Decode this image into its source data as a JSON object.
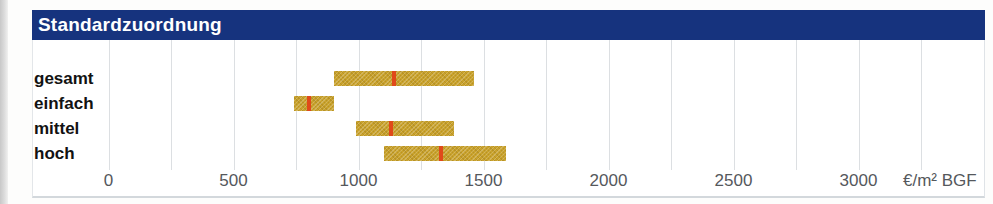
{
  "title": "Standardzuordnung",
  "axis": {
    "unit_label": "€/m² BGF"
  },
  "chart_data": {
    "type": "bar",
    "orientation": "horizontal-range",
    "title": "Standardzuordnung",
    "categories": [
      "gesamt",
      "einfach",
      "mittel",
      "hoch"
    ],
    "series": [
      {
        "name": "range_min",
        "values": [
          900,
          740,
          990,
          1100
        ]
      },
      {
        "name": "range_max",
        "values": [
          1460,
          900,
          1380,
          1590
        ]
      },
      {
        "name": "median_marker",
        "values": [
          1140,
          800,
          1130,
          1330
        ]
      }
    ],
    "xlabel": "€/m² BGF",
    "xticks": [
      0,
      500,
      1000,
      1500,
      2000,
      2500,
      3000
    ],
    "grid_step": 250,
    "xlim": [
      0,
      3250
    ],
    "grid": true,
    "legend": "none"
  },
  "colors": {
    "header_bg": "#16337e",
    "bar_fill": "#c9a22c",
    "bar_texture": "#8c6e14",
    "marker_red": "#e0491a",
    "gridline": "#dcdfe2",
    "axis_text": "#55585c",
    "category_text": "#121212"
  }
}
